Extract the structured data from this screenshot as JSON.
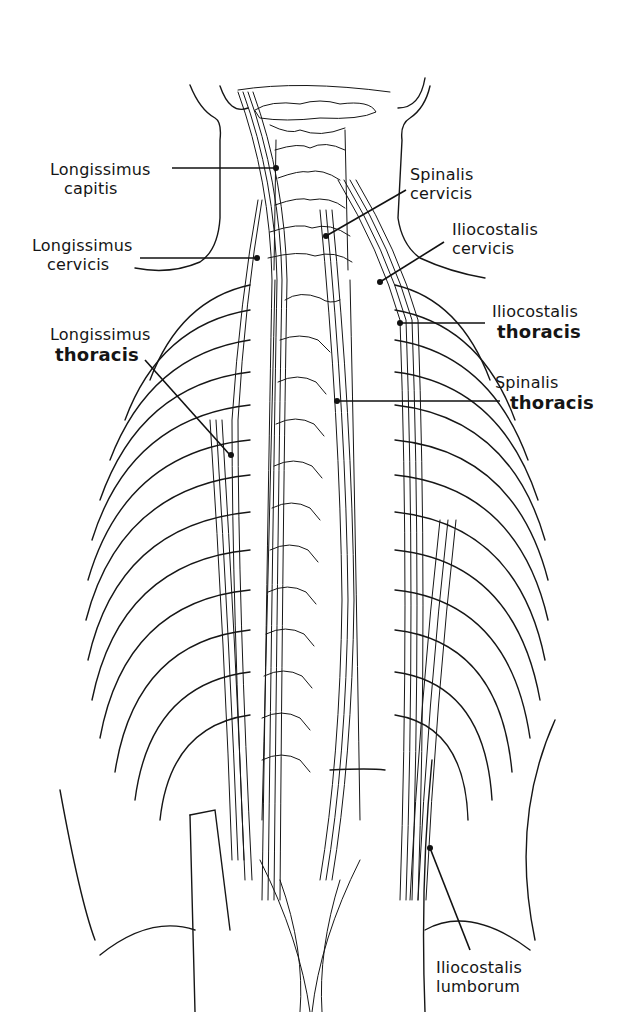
{
  "figure": {
    "labels": [
      {
        "id": "longissimus-capitis",
        "line1": "Longissimus",
        "line2": "capitis",
        "side": "left"
      },
      {
        "id": "longissimus-cervicis",
        "line1": "Longissimus",
        "line2": "cervicis",
        "side": "left"
      },
      {
        "id": "longissimus-thoracis",
        "line1": "Longissimus",
        "line2": "thoracis",
        "side": "left"
      },
      {
        "id": "spinalis-cervicis",
        "line1": "Spinalis",
        "line2": "cervicis",
        "side": "right"
      },
      {
        "id": "iliocostalis-cervicis",
        "line1": "Iliocostalis",
        "line2": "cervicis",
        "side": "right"
      },
      {
        "id": "iliocostalis-thoracis",
        "line1": "Iliocostalis",
        "line2": "thoracis",
        "side": "right"
      },
      {
        "id": "spinalis-thoracis",
        "line1": "Spinalis",
        "line2": "thoracis",
        "side": "right"
      },
      {
        "id": "iliocostalis-lumborum",
        "line1": "Iliocostalis",
        "line2": "lumborum",
        "side": "right"
      }
    ],
    "colors": {
      "ink": "#161616",
      "paper": "#ffffff"
    }
  }
}
